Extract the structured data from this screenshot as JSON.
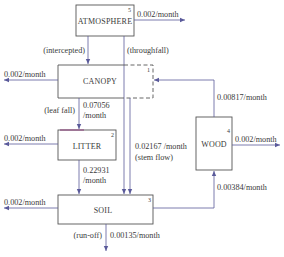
{
  "colors": {
    "box_stroke": "#555555",
    "arrow": "#5a5a9a",
    "text": "#3a3a3a",
    "litter_top_accent": "#8a3a7a"
  },
  "compartments": {
    "atmosphere": {
      "label": "ATMOSPHERE",
      "number": "5"
    },
    "canopy": {
      "label": "CANOPY",
      "number": "1"
    },
    "litter": {
      "label": "LITTER",
      "number": "2"
    },
    "wood": {
      "label": "WOOD",
      "number": "4"
    },
    "soil": {
      "label": "SOIL",
      "number": "3"
    }
  },
  "flows": {
    "atmosphere_out": "0.002/month",
    "intercepted": "(intercepted)",
    "throughfall": "(throughfall)",
    "canopy_out": "0.002/month",
    "leaf_fall_label": "(leaf fall)",
    "leaf_fall_rate_1": "0.07056",
    "leaf_fall_rate_2": "/month",
    "litter_out": "0.002/month",
    "litter_to_soil_1": "0.22931",
    "litter_to_soil_2": "/month",
    "stem_flow_rate": "0.02167 /month",
    "stem_flow_label": "(stem flow)",
    "wood_to_canopy": "0.00817/month",
    "wood_out": "0.002/month",
    "soil_to_wood": "0.00384/month",
    "soil_out": "0.002/month",
    "runoff_label": "(run-off)",
    "runoff_rate": "0.00135/month"
  }
}
